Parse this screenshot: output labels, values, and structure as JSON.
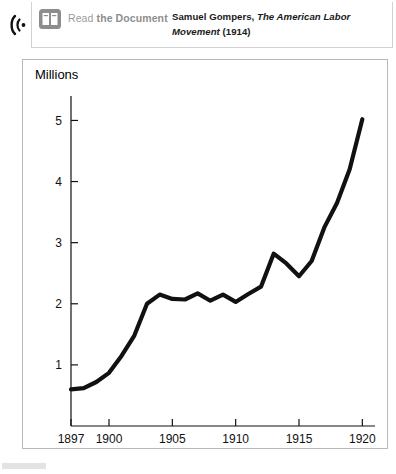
{
  "header": {
    "audio_icon": "audio-wave-icon",
    "book_icon": "open-book-icon",
    "read_link_plain": "Read ",
    "read_link_bold": "the Document",
    "citation_author": "Samuel Gompers, ",
    "citation_title": "The American Labor Movement",
    "citation_year": " (1914)"
  },
  "chart_data": {
    "type": "line",
    "title": "",
    "ylabel": "Millions",
    "xlabel": "",
    "xlim": [
      1897,
      1921
    ],
    "ylim": [
      0,
      5.4
    ],
    "grid": false,
    "legend": "none",
    "line_color": "#111111",
    "yticks": [
      "1",
      "2",
      "3",
      "4",
      "5"
    ],
    "ytick_values": [
      1,
      2,
      3,
      4,
      5
    ],
    "xticks": [
      "1897",
      "1900",
      "1905",
      "1910",
      "1915",
      "1920"
    ],
    "xtick_values": [
      1897,
      1900,
      1905,
      1910,
      1915,
      1920
    ],
    "x": [
      1897,
      1898,
      1899,
      1900,
      1901,
      1902,
      1903,
      1904,
      1905,
      1906,
      1907,
      1908,
      1909,
      1910,
      1911,
      1912,
      1913,
      1914,
      1915,
      1916,
      1917,
      1918,
      1919,
      1920
    ],
    "values": [
      0.6,
      0.62,
      0.72,
      0.87,
      1.15,
      1.48,
      2.0,
      2.15,
      2.08,
      2.07,
      2.17,
      2.05,
      2.15,
      2.03,
      2.16,
      2.28,
      2.82,
      2.66,
      2.45,
      2.7,
      3.25,
      3.65,
      4.2,
      5.02
    ],
    "series": [
      {
        "name": "Union membership",
        "values": [
          0.6,
          0.62,
          0.72,
          0.87,
          1.15,
          1.48,
          2.0,
          2.15,
          2.08,
          2.07,
          2.17,
          2.05,
          2.15,
          2.03,
          2.16,
          2.28,
          2.82,
          2.66,
          2.45,
          2.7,
          3.25,
          3.65,
          4.2,
          5.02
        ]
      }
    ]
  }
}
